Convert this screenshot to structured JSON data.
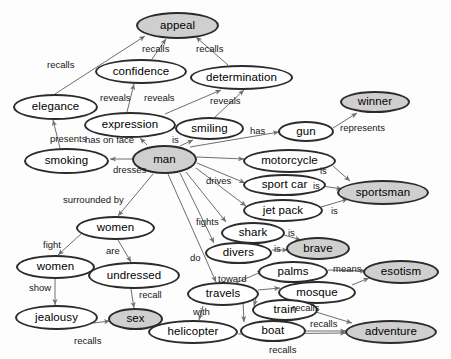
{
  "diagram": {
    "type": "concept-map",
    "width": 451,
    "height": 359,
    "background_color": "#fdfdfd",
    "node_fill_default": "#ffffff",
    "node_fill_highlight": "#cfcfcf",
    "node_stroke_color": "#2b2b2b",
    "edge_color": "#6e6e6e"
  },
  "nodes": [
    {
      "id": "appeal",
      "label": "appeal",
      "x": 136,
      "y": 12,
      "w": 83,
      "h": 27,
      "fs": 11.5,
      "highlight": true
    },
    {
      "id": "confidence",
      "label": "confidence",
      "x": 95,
      "y": 59,
      "w": 92,
      "h": 25,
      "fs": 11.5,
      "highlight": false
    },
    {
      "id": "determination",
      "label": "determination",
      "x": 190,
      "y": 65,
      "w": 103,
      "h": 25,
      "fs": 11.5,
      "highlight": false
    },
    {
      "id": "elegance",
      "label": "elegance",
      "x": 13,
      "y": 94,
      "w": 85,
      "h": 26,
      "fs": 11.5,
      "highlight": false
    },
    {
      "id": "expression",
      "label": "expression",
      "x": 84,
      "y": 112,
      "w": 92,
      "h": 26,
      "fs": 11.5,
      "highlight": false
    },
    {
      "id": "smiling",
      "label": "smiling",
      "x": 175,
      "y": 117,
      "w": 69,
      "h": 23,
      "fs": 11.5,
      "highlight": false
    },
    {
      "id": "winner",
      "label": "winner",
      "x": 340,
      "y": 91,
      "w": 70,
      "h": 22,
      "fs": 11.5,
      "highlight": true
    },
    {
      "id": "gun",
      "label": "gun",
      "x": 278,
      "y": 121,
      "w": 56,
      "h": 21,
      "fs": 11.5,
      "highlight": false
    },
    {
      "id": "smoking",
      "label": "smoking",
      "x": 24,
      "y": 148,
      "w": 85,
      "h": 26,
      "fs": 11.5,
      "highlight": false
    },
    {
      "id": "man",
      "label": "man",
      "x": 132,
      "y": 145,
      "w": 65,
      "h": 29,
      "fs": 11.5,
      "highlight": true
    },
    {
      "id": "motorcycle",
      "label": "motorcycle",
      "x": 243,
      "y": 149,
      "w": 93,
      "h": 24,
      "fs": 11.5,
      "highlight": false
    },
    {
      "id": "sport_car",
      "label": "sport car",
      "x": 243,
      "y": 174,
      "w": 83,
      "h": 22,
      "fs": 11.5,
      "highlight": false
    },
    {
      "id": "sportsman",
      "label": "sportsman",
      "x": 337,
      "y": 180,
      "w": 92,
      "h": 25,
      "fs": 11.5,
      "highlight": true
    },
    {
      "id": "jet_pack",
      "label": "jet pack",
      "x": 243,
      "y": 199,
      "w": 80,
      "h": 23,
      "fs": 11.5,
      "highlight": false
    },
    {
      "id": "women_top",
      "label": "women",
      "x": 76,
      "y": 216,
      "w": 79,
      "h": 24,
      "fs": 11.5,
      "highlight": false
    },
    {
      "id": "shark",
      "label": "shark",
      "x": 221,
      "y": 222,
      "w": 64,
      "h": 22,
      "fs": 11.5,
      "highlight": false
    },
    {
      "id": "brave",
      "label": "brave",
      "x": 286,
      "y": 237,
      "w": 64,
      "h": 23,
      "fs": 11.5,
      "highlight": true
    },
    {
      "id": "divers",
      "label": "divers",
      "x": 205,
      "y": 242,
      "w": 67,
      "h": 22,
      "fs": 11.5,
      "highlight": false
    },
    {
      "id": "women_left",
      "label": "women",
      "x": 16,
      "y": 255,
      "w": 79,
      "h": 24,
      "fs": 11.5,
      "highlight": false
    },
    {
      "id": "undressed",
      "label": "undressed",
      "x": 88,
      "y": 262,
      "w": 92,
      "h": 27,
      "fs": 11.5,
      "highlight": false
    },
    {
      "id": "palms",
      "label": "palms",
      "x": 258,
      "y": 261,
      "w": 70,
      "h": 22,
      "fs": 11.5,
      "highlight": false
    },
    {
      "id": "esotism",
      "label": "esotism",
      "x": 363,
      "y": 260,
      "w": 76,
      "h": 24,
      "fs": 11.5,
      "highlight": true
    },
    {
      "id": "mosque",
      "label": "mosque",
      "x": 278,
      "y": 281,
      "w": 78,
      "h": 23,
      "fs": 11.5,
      "highlight": false
    },
    {
      "id": "travels",
      "label": "travels",
      "x": 187,
      "y": 282,
      "w": 72,
      "h": 24,
      "fs": 11.5,
      "highlight": false
    },
    {
      "id": "train",
      "label": "train",
      "x": 252,
      "y": 299,
      "w": 66,
      "h": 22,
      "fs": 11.5,
      "highlight": false
    },
    {
      "id": "jealousy",
      "label": "jealousy",
      "x": 15,
      "y": 305,
      "w": 83,
      "h": 25,
      "fs": 11.5,
      "highlight": false
    },
    {
      "id": "sex",
      "label": "sex",
      "x": 108,
      "y": 308,
      "w": 55,
      "h": 22,
      "fs": 11.5,
      "highlight": true
    },
    {
      "id": "boat",
      "label": "boat",
      "x": 240,
      "y": 320,
      "w": 66,
      "h": 22,
      "fs": 11.5,
      "highlight": false
    },
    {
      "id": "helicopter",
      "label": "helicopter",
      "x": 148,
      "y": 320,
      "w": 90,
      "h": 24,
      "fs": 11.5,
      "highlight": false
    },
    {
      "id": "adventure",
      "label": "adventure",
      "x": 345,
      "y": 320,
      "w": 92,
      "h": 24,
      "fs": 11.5,
      "highlight": true
    }
  ],
  "edges": [
    {
      "from": "elegance",
      "to": "appeal",
      "label": "recalls",
      "lx": 47,
      "ly": 60,
      "x1": 55,
      "y1": 94,
      "x2": 145,
      "y2": 36
    },
    {
      "from": "confidence",
      "to": "appeal",
      "label": "recalls",
      "lx": 142,
      "ly": 44,
      "x1": 152,
      "y1": 59,
      "x2": 166,
      "y2": 39
    },
    {
      "from": "determination",
      "to": "appeal",
      "label": "recalls",
      "lx": 196,
      "ly": 44,
      "x1": 228,
      "y1": 65,
      "x2": 196,
      "y2": 37
    },
    {
      "from": "expression",
      "to": "confidence",
      "label": "reveals",
      "lx": 100,
      "ly": 93,
      "x1": 127,
      "y1": 112,
      "x2": 134,
      "y2": 84
    },
    {
      "from": "expression",
      "to": "determination",
      "label": "reveals",
      "lx": 144,
      "ly": 93,
      "x1": 165,
      "y1": 114,
      "x2": 221,
      "y2": 90
    },
    {
      "from": "smiling",
      "to": "determination",
      "label": "reveals",
      "lx": 210,
      "ly": 96,
      "x1": 215,
      "y1": 117,
      "x2": 244,
      "y2": 90
    },
    {
      "from": "smoking",
      "to": "elegance",
      "label": "presents",
      "lx": 50,
      "ly": 134,
      "x1": 60,
      "y1": 148,
      "x2": 53,
      "y2": 120
    },
    {
      "from": "man",
      "to": "expression",
      "label": "has on face",
      "lx": 85,
      "ly": 135,
      "x1": 147,
      "y1": 145,
      "x2": 140,
      "y2": 138
    },
    {
      "from": "man",
      "to": "smiling",
      "label": "is",
      "lx": 172,
      "ly": 135,
      "x1": 180,
      "y1": 146,
      "x2": 193,
      "y2": 140
    },
    {
      "from": "man",
      "to": "smoking",
      "label": "dresses",
      "lx": 113,
      "ly": 165,
      "x1": 132,
      "y1": 159,
      "x2": 110,
      "y2": 159
    },
    {
      "from": "man",
      "to": "gun",
      "label": "has",
      "lx": 250,
      "ly": 126,
      "x1": 190,
      "y1": 147,
      "x2": 279,
      "y2": 132
    },
    {
      "from": "gun",
      "to": "winner",
      "label": "represents",
      "lx": 340,
      "ly": 123,
      "x1": 333,
      "y1": 128,
      "x2": 357,
      "y2": 113
    },
    {
      "from": "man",
      "to": "motorcycle",
      "label": "",
      "lx": 0,
      "ly": 0,
      "x1": 197,
      "y1": 157,
      "x2": 244,
      "y2": 159
    },
    {
      "from": "man",
      "to": "sport_car",
      "label": "drives",
      "lx": 206,
      "ly": 176,
      "x1": 197,
      "y1": 163,
      "x2": 245,
      "y2": 183
    },
    {
      "from": "man",
      "to": "jet_pack",
      "label": "",
      "lx": 0,
      "ly": 0,
      "x1": 196,
      "y1": 168,
      "x2": 246,
      "y2": 206
    },
    {
      "from": "motorcycle",
      "to": "sportsman",
      "label": "is",
      "lx": 320,
      "ly": 166,
      "x1": 333,
      "y1": 166,
      "x2": 350,
      "y2": 181
    },
    {
      "from": "sport_car",
      "to": "sportsman",
      "label": "is",
      "lx": 313,
      "ly": 181,
      "x1": 322,
      "y1": 186,
      "x2": 342,
      "y2": 189
    },
    {
      "from": "jet_pack",
      "to": "sportsman",
      "label": "is",
      "lx": 331,
      "ly": 206,
      "x1": 321,
      "y1": 207,
      "x2": 348,
      "y2": 199
    },
    {
      "from": "man",
      "to": "shark",
      "label": "fights",
      "lx": 196,
      "ly": 217,
      "x1": 186,
      "y1": 172,
      "x2": 226,
      "y2": 222
    },
    {
      "from": "man",
      "to": "divers",
      "label": "",
      "lx": 0,
      "ly": 0,
      "x1": 180,
      "y1": 173,
      "x2": 214,
      "y2": 243
    },
    {
      "from": "shark",
      "to": "brave",
      "label": "is",
      "lx": 288,
      "ly": 228,
      "x1": 284,
      "y1": 235,
      "x2": 301,
      "y2": 240
    },
    {
      "from": "divers",
      "to": "brave",
      "label": "is",
      "lx": 274,
      "ly": 244,
      "x1": 272,
      "y1": 250,
      "x2": 288,
      "y2": 250
    },
    {
      "from": "man",
      "to": "women_top",
      "label": "surrounded by",
      "lx": 63,
      "ly": 195,
      "x1": 153,
      "y1": 174,
      "x2": 118,
      "y2": 216
    },
    {
      "from": "women_top",
      "to": "women_left",
      "label": "fight",
      "lx": 43,
      "ly": 240,
      "x1": 82,
      "y1": 233,
      "x2": 58,
      "y2": 255
    },
    {
      "from": "women_top",
      "to": "undressed",
      "label": "are",
      "lx": 106,
      "ly": 246,
      "x1": 118,
      "y1": 240,
      "x2": 131,
      "y2": 262
    },
    {
      "from": "women_left",
      "to": "jealousy",
      "label": "show",
      "lx": 29,
      "ly": 283,
      "x1": 55,
      "y1": 279,
      "x2": 55,
      "y2": 305
    },
    {
      "from": "undressed",
      "to": "sex",
      "label": "recall",
      "lx": 139,
      "ly": 290,
      "x1": 131,
      "y1": 289,
      "x2": 134,
      "y2": 308
    },
    {
      "from": "jealousy",
      "to": "sex",
      "label": "recalls",
      "lx": 74,
      "ly": 336,
      "x1": 93,
      "y1": 323,
      "x2": 110,
      "y2": 321
    },
    {
      "from": "man",
      "to": "travels",
      "label": "do",
      "lx": 190,
      "ly": 253,
      "x1": 168,
      "y1": 174,
      "x2": 216,
      "y2": 282
    },
    {
      "from": "travels",
      "to": "palms",
      "label": "toward",
      "lx": 218,
      "ly": 274,
      "x1": 236,
      "y1": 283,
      "x2": 263,
      "y2": 271
    },
    {
      "from": "travels",
      "to": "mosque",
      "label": "",
      "lx": 0,
      "ly": 0,
      "x1": 258,
      "y1": 290,
      "x2": 280,
      "y2": 288
    },
    {
      "from": "travels",
      "to": "train",
      "label": "",
      "lx": 0,
      "ly": 0,
      "x1": 256,
      "y1": 298,
      "x2": 254,
      "y2": 306
    },
    {
      "from": "travels",
      "to": "boat",
      "label": "",
      "lx": 0,
      "ly": 0,
      "x1": 243,
      "y1": 302,
      "x2": 244,
      "y2": 322
    },
    {
      "from": "travels",
      "to": "helicopter",
      "label": "with",
      "lx": 193,
      "ly": 307,
      "x1": 203,
      "y1": 306,
      "x2": 199,
      "y2": 320
    },
    {
      "from": "palms",
      "to": "esotism",
      "label": "means",
      "lx": 333,
      "ly": 264,
      "x1": 328,
      "y1": 270,
      "x2": 366,
      "y2": 271
    },
    {
      "from": "mosque",
      "to": "esotism",
      "label": "",
      "lx": 0,
      "ly": 0,
      "x1": 352,
      "y1": 285,
      "x2": 369,
      "y2": 278
    },
    {
      "from": "train",
      "to": "adventure",
      "label": "recalls",
      "lx": 292,
      "ly": 303,
      "x1": 316,
      "y1": 312,
      "x2": 352,
      "y2": 323
    },
    {
      "from": "boat",
      "to": "adventure",
      "label": "recalls",
      "lx": 310,
      "ly": 319,
      "x1": 306,
      "y1": 331,
      "x2": 346,
      "y2": 331
    },
    {
      "from": "helicopter",
      "to": "adventure",
      "label": "recalls",
      "lx": 269,
      "ly": 345,
      "x1": 238,
      "y1": 334,
      "x2": 346,
      "y2": 333
    }
  ]
}
